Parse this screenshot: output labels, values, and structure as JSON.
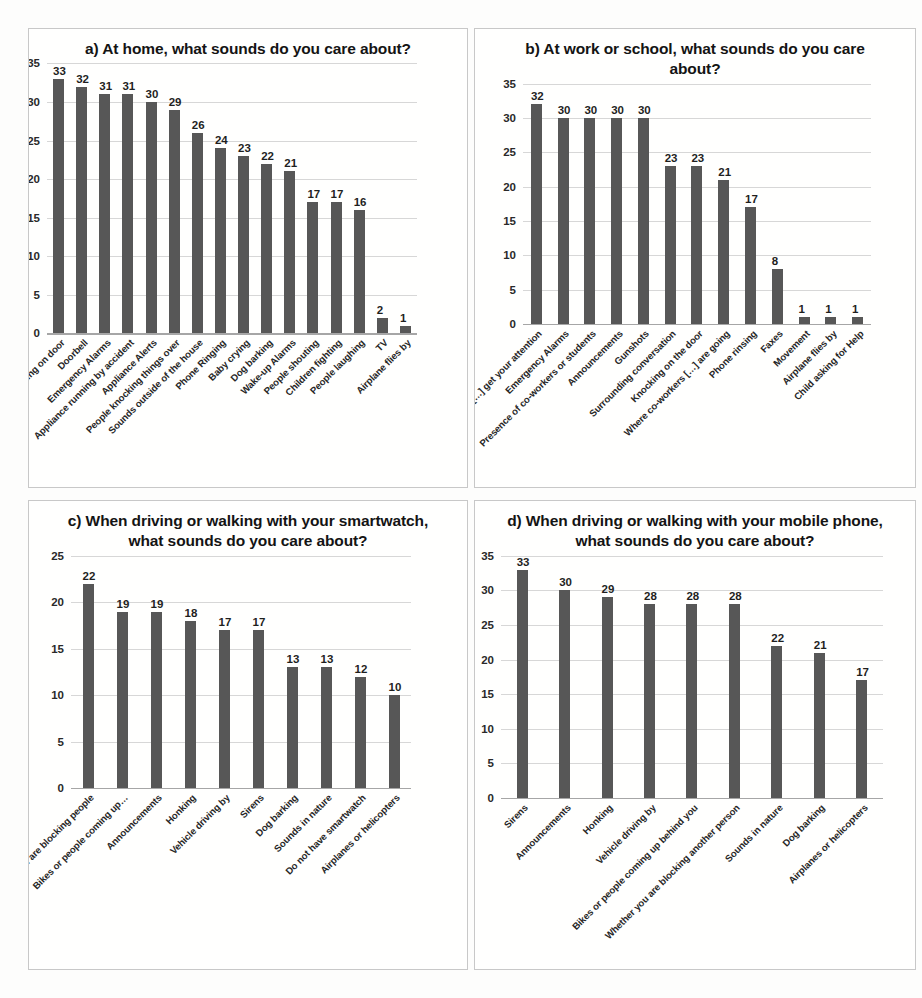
{
  "figure": {
    "background": "#fdfdfc",
    "bar_color": "#575757",
    "gridline_color": "#d0d0d0",
    "panel_border": "#c8c8c8"
  },
  "chart_data": [
    {
      "type": "bar",
      "panel": "a",
      "title": "a) At home, what sounds do you care about?",
      "xlabel": "",
      "ylabel": "",
      "ylim": [
        0,
        35
      ],
      "ytick_step": 5,
      "yticks": [
        0,
        5,
        10,
        15,
        20,
        25,
        30,
        35
      ],
      "grid": true,
      "legend": "none",
      "categories": [
        "Knocking on door",
        "Doorbell",
        "Emergency Alarms",
        "Appliance running by accident",
        "Appliance Alerts",
        "People knocking things over",
        "Sounds outside of the house",
        "Phone Ringing",
        "Baby crying",
        "Dog barking",
        "Wake-up Alarms",
        "People shouting",
        "Children fighting",
        "People laughing",
        "TV",
        "Airplane flies by"
      ],
      "values": [
        33,
        32,
        31,
        31,
        30,
        29,
        26,
        24,
        23,
        22,
        21,
        17,
        17,
        16,
        2,
        1
      ]
    },
    {
      "type": "bar",
      "panel": "b",
      "title": "b) At work or school, what sounds do you care about?",
      "xlabel": "",
      "ylabel": "",
      "ylim": [
        0,
        35
      ],
      "ytick_step": 5,
      "yticks": [
        0,
        5,
        10,
        15,
        20,
        25,
        30,
        35
      ],
      "grid": true,
      "legend": "none",
      "categories": [
        "Co-workers […] get your attention",
        "Emergency Alarms",
        "Presence of co-workers or students",
        "Announcements",
        "Gunshots",
        "Surrounding conversation",
        "Knocking on the door",
        "Where co-workers […] are going",
        "Phone rinsing",
        "Faxes",
        "Movement",
        "Airplane flies by",
        "Child asking for Help"
      ],
      "values": [
        32,
        30,
        30,
        30,
        30,
        23,
        23,
        21,
        17,
        8,
        1,
        1,
        1
      ]
    },
    {
      "type": "bar",
      "panel": "c",
      "title": "c) When driving or walking with your smartwatch, what sounds do you care about?",
      "xlabel": "",
      "ylabel": "",
      "ylim": [
        0,
        25
      ],
      "ytick_step": 5,
      "yticks": [
        0,
        5,
        10,
        15,
        20,
        25
      ],
      "grid": true,
      "legend": "none",
      "categories": [
        "[…] you are blocking people",
        "Bikes or people coming up…",
        "Announcements",
        "Honking",
        "Vehicle driving by",
        "Sirens",
        "Dog barking",
        "Sounds in nature",
        "Do not have smartwatch",
        "Airplanes or helicopters"
      ],
      "values": [
        22,
        19,
        19,
        18,
        17,
        17,
        13,
        13,
        12,
        10
      ]
    },
    {
      "type": "bar",
      "panel": "d",
      "title": "d) When driving or walking with your mobile phone, what sounds do you care about?",
      "xlabel": "",
      "ylabel": "",
      "ylim": [
        0,
        35
      ],
      "ytick_step": 5,
      "yticks": [
        0,
        5,
        10,
        15,
        20,
        25,
        30,
        35
      ],
      "grid": true,
      "legend": "none",
      "categories": [
        "Sirens",
        "Announcements",
        "Honking",
        "Vehicle driving by",
        "Bikes or people coming up behind you",
        "Whether you are blocking another person",
        "Sounds in nature",
        "Dog barking",
        "Airplanes or helicopters"
      ],
      "values": [
        33,
        30,
        29,
        28,
        28,
        28,
        22,
        21,
        17
      ]
    }
  ]
}
